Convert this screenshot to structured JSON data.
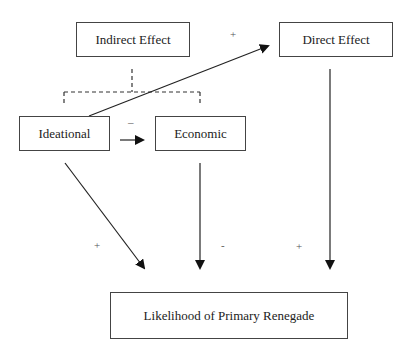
{
  "diagram": {
    "nodes": {
      "indirect_effect": "Indirect Effect",
      "direct_effect": "Direct Effect",
      "ideational": "Ideational",
      "economic": "Economic",
      "outcome": "Likelihood of Primary Renegade"
    },
    "edges": [
      {
        "from": "Ideational",
        "to": "Direct Effect",
        "sign": "+"
      },
      {
        "from": "Ideational",
        "to": "Economic",
        "sign": "–"
      },
      {
        "from": "Ideational",
        "to": "Likelihood of Primary Renegade",
        "sign": "+"
      },
      {
        "from": "Economic",
        "to": "Likelihood of Primary Renegade",
        "sign": "-"
      },
      {
        "from": "Direct Effect",
        "to": "Likelihood of Primary Renegade",
        "sign": "+"
      }
    ],
    "grouping": {
      "label": "Indirect Effect",
      "members": [
        "Ideational",
        "Economic"
      ],
      "style": "dashed bracket"
    }
  }
}
